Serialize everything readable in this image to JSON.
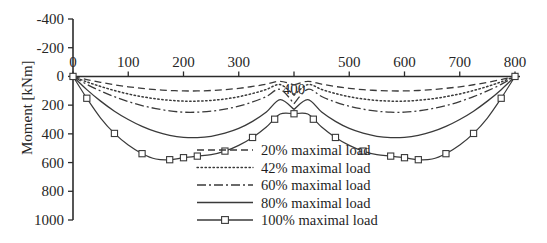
{
  "chart_data": {
    "type": "line",
    "title": "",
    "xlabel": "",
    "ylabel": "Moment [kNm]",
    "xlim": [
      0,
      800
    ],
    "ylim": [
      -400,
      1000
    ],
    "y_axis_inverted": true,
    "grid": false,
    "legend_position": "inside-bottom-center",
    "x_ticks": [
      0,
      100,
      200,
      300,
      400,
      500,
      600,
      700,
      800
    ],
    "x_tick_labels": [
      "0",
      "100",
      "200",
      "300",
      "400",
      "500",
      "600",
      "700",
      "800"
    ],
    "x_tick_label_below_axis": [
      "400"
    ],
    "y_ticks": [
      -400,
      -200,
      0,
      200,
      400,
      600,
      800,
      1000
    ],
    "y_tick_labels": [
      "-400",
      "-200",
      "0",
      "200",
      "400",
      "600",
      "800",
      "1000"
    ],
    "x": [
      0,
      25,
      50,
      75,
      100,
      125,
      150,
      175,
      200,
      225,
      250,
      275,
      300,
      325,
      350,
      375,
      400,
      425,
      450,
      475,
      500,
      525,
      550,
      575,
      600,
      625,
      650,
      675,
      700,
      725,
      750,
      775,
      800
    ],
    "series": [
      {
        "name": "20% maximal load",
        "style": "dashed",
        "markers": false,
        "values": [
          0,
          -22,
          -41,
          -58,
          -72,
          -83,
          -92,
          -98,
          -101,
          -101,
          -98,
          -92,
          -83,
          -70,
          -54,
          -34,
          -60,
          -34,
          -54,
          -70,
          -83,
          -92,
          -98,
          -101,
          -101,
          -98,
          -92,
          -83,
          -72,
          -58,
          -41,
          -22,
          0
        ]
      },
      {
        "name": "42% maximal load",
        "style": "dotted",
        "markers": false,
        "values": [
          0,
          -38,
          -70,
          -98,
          -122,
          -141,
          -156,
          -166,
          -172,
          -172,
          -167,
          -157,
          -141,
          -119,
          -91,
          -57,
          -130,
          -57,
          -91,
          -119,
          -141,
          -157,
          -167,
          -172,
          -172,
          -166,
          -156,
          -141,
          -122,
          -98,
          -70,
          -38,
          0
        ]
      },
      {
        "name": "60% maximal load",
        "style": "dashdot",
        "markers": false,
        "values": [
          0,
          -55,
          -101,
          -141,
          -175,
          -203,
          -224,
          -240,
          -249,
          -249,
          -242,
          -228,
          -207,
          -178,
          -140,
          -90,
          -190,
          -90,
          -140,
          -178,
          -207,
          -228,
          -242,
          -249,
          -249,
          -240,
          -224,
          -203,
          -175,
          -141,
          -101,
          -55,
          0
        ]
      },
      {
        "name": "80% maximal load",
        "style": "solid",
        "markers": false,
        "values": [
          0,
          -92,
          -172,
          -242,
          -300,
          -348,
          -385,
          -410,
          -424,
          -426,
          -417,
          -395,
          -362,
          -313,
          -248,
          -162,
          -230,
          -162,
          -248,
          -313,
          -362,
          -395,
          -417,
          -426,
          -424,
          -410,
          -385,
          -348,
          -300,
          -242,
          -172,
          -92,
          0
        ]
      },
      {
        "name": "100% maximal load",
        "style": "solid",
        "markers": true,
        "marker_shape": "square",
        "marker_x": [
          0,
          25,
          75,
          125,
          175,
          200,
          225,
          275,
          325,
          365,
          400,
          435,
          475,
          525,
          575,
          625,
          675,
          725,
          775,
          800
        ],
        "values": [
          0,
          -152,
          -290,
          -397,
          -478,
          -538,
          -575,
          -580,
          -566,
          -555,
          -545,
          -520,
          -480,
          -425,
          -352,
          -262,
          -260,
          -262,
          -352,
          -425,
          -480,
          -520,
          -545,
          -555,
          -566,
          -580,
          -575,
          -538,
          -478,
          -397,
          -290,
          -152,
          0
        ]
      }
    ]
  },
  "legend": {
    "entries": [
      {
        "label": "20% maximal load",
        "style": "dashed",
        "marker": false
      },
      {
        "label": "42% maximal load",
        "style": "dotted",
        "marker": false
      },
      {
        "label": "60% maximal load",
        "style": "dashdot",
        "marker": false
      },
      {
        "label": "80% maximal load",
        "style": "solid",
        "marker": false
      },
      {
        "label": "100% maximal load",
        "style": "solid",
        "marker": true
      }
    ]
  },
  "colors": {
    "line": "#3a3a3a",
    "axis": "#2b2b2b",
    "text": "#262626",
    "background": "#ffffff"
  }
}
